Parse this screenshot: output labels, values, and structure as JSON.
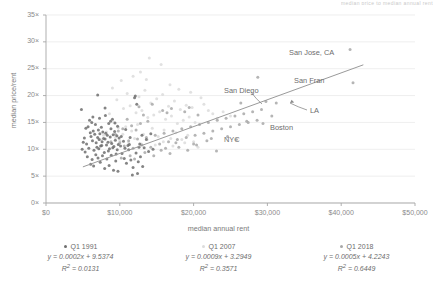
{
  "clipped_title": "median price to median annual rent",
  "axes": {
    "xlabel": "median annual rent",
    "ylabel": "median price/rent",
    "xticks": [
      "$0",
      "$10,000",
      "$20,000",
      "$30,000",
      "$40,000",
      "$50,000"
    ],
    "yticks": [
      "0×",
      "5×",
      "10×",
      "15×",
      "20×",
      "25×",
      "30×",
      "35×"
    ]
  },
  "annotations": [
    {
      "name": "san-jose",
      "text": "San Jose, CA",
      "x": 289,
      "y": 48
    },
    {
      "name": "san-fran",
      "text": "San Fran",
      "x": 294,
      "y": 76
    },
    {
      "name": "san-diego",
      "text": "San Diego",
      "x": 224,
      "y": 86
    },
    {
      "name": "la",
      "text": "LA",
      "x": 310,
      "y": 106
    },
    {
      "name": "boston",
      "text": "Boston",
      "x": 270,
      "y": 123
    },
    {
      "name": "nyc",
      "text": "NYC",
      "x": 224,
      "y": 135
    }
  ],
  "legend": [
    {
      "label": "Q1 1991",
      "color": "#6f6f6f",
      "equation": "y = 0.0002x + 9.5374",
      "r2_value": "0.0131"
    },
    {
      "label": "Q1 2007",
      "color": "#dcdcdc",
      "equation": "y = 0.0009x + 3.2949",
      "r2_value": "0.3571"
    },
    {
      "label": "Q1 2018",
      "color": "#a8a8a8",
      "equation": "y = 0.0005x + 4.2243",
      "r2_value": "0.6449"
    }
  ],
  "chart_data": {
    "type": "scatter",
    "title": "median price to median annual rent",
    "xlabel": "median annual rent",
    "ylabel": "median price/rent",
    "xlim": [
      0,
      50000
    ],
    "ylim": [
      0,
      35
    ],
    "grid": "horizontal",
    "legend_position": "bottom",
    "trendlines": [
      {
        "name": "Q1 1991",
        "slope": 0.0002,
        "intercept": 9.5374,
        "r2": 0.0131,
        "visible": false
      },
      {
        "name": "Q1 2007",
        "slope": 0.0009,
        "intercept": 3.2949,
        "r2": 0.3571,
        "visible": false
      },
      {
        "name": "Q1 2018",
        "slope": 0.0005,
        "intercept": 4.2243,
        "r2": 0.6449,
        "visible": true,
        "x_range": [
          5000,
          43000
        ]
      }
    ],
    "highlighted_cities": [
      {
        "name": "San Jose, CA",
        "x": 41200,
        "y": 28.6
      },
      {
        "name": "San Fran",
        "x": 41600,
        "y": 22.4
      },
      {
        "name": "San Diego",
        "x": 30000,
        "y": 18.9
      },
      {
        "name": "LA",
        "x": 31200,
        "y": 18.6
      },
      {
        "name": "Boston",
        "x": 28700,
        "y": 23.4
      },
      {
        "name": "NYC",
        "x": 23100,
        "y": 9.7
      }
    ],
    "series": [
      {
        "name": "Q1 1991",
        "color": "#6f6f6f",
        "points": [
          [
            4800,
            17.4
          ],
          [
            5200,
            12.1
          ],
          [
            5400,
            13.9
          ],
          [
            5500,
            11.0
          ],
          [
            5700,
            14.2
          ],
          [
            5800,
            10.2
          ],
          [
            6000,
            13.1
          ],
          [
            6100,
            12.4
          ],
          [
            6200,
            15.0
          ],
          [
            6300,
            11.6
          ],
          [
            6400,
            13.4
          ],
          [
            6500,
            9.8
          ],
          [
            6600,
            12.8
          ],
          [
            6700,
            14.6
          ],
          [
            6800,
            11.2
          ],
          [
            6900,
            10.4
          ],
          [
            7000,
            20.1
          ],
          [
            7000,
            12.2
          ],
          [
            7100,
            13.6
          ],
          [
            7200,
            11.8
          ],
          [
            7300,
            12.9
          ],
          [
            7400,
            10.6
          ],
          [
            7500,
            14.1
          ],
          [
            7600,
            11.4
          ],
          [
            7700,
            13.2
          ],
          [
            7800,
            12.0
          ],
          [
            7900,
            9.4
          ],
          [
            8000,
            17.7
          ],
          [
            8000,
            11.9
          ],
          [
            8100,
            13.0
          ],
          [
            8200,
            10.8
          ],
          [
            8300,
            12.6
          ],
          [
            8400,
            11.3
          ],
          [
            8500,
            14.8
          ],
          [
            8600,
            10.1
          ],
          [
            8700,
            12.3
          ],
          [
            8800,
            13.8
          ],
          [
            8900,
            11.1
          ],
          [
            9000,
            15.6
          ],
          [
            9100,
            12.7
          ],
          [
            9200,
            10.5
          ],
          [
            9300,
            13.3
          ],
          [
            9400,
            11.7
          ],
          [
            9500,
            9.1
          ],
          [
            9600,
            12.5
          ],
          [
            9700,
            14.3
          ],
          [
            9800,
            10.9
          ],
          [
            9900,
            12.1
          ],
          [
            5600,
            8.6
          ],
          [
            6050,
            7.2
          ],
          [
            6250,
            8.1
          ],
          [
            6450,
            6.9
          ],
          [
            6750,
            9.0
          ],
          [
            7050,
            8.4
          ],
          [
            7350,
            7.6
          ],
          [
            7650,
            8.8
          ],
          [
            7950,
            6.4
          ],
          [
            8250,
            8.2
          ],
          [
            8550,
            7.0
          ],
          [
            8850,
            8.9
          ],
          [
            9150,
            6.1
          ],
          [
            9450,
            7.8
          ],
          [
            9750,
            5.9
          ],
          [
            10200,
            12.4
          ],
          [
            10500,
            11.5
          ],
          [
            10800,
            13.7
          ],
          [
            11100,
            10.7
          ],
          [
            11400,
            12.2
          ],
          [
            11700,
            5.2
          ],
          [
            12000,
            19.6
          ],
          [
            12100,
            19.9
          ],
          [
            12300,
            18.4
          ],
          [
            12400,
            5.5
          ],
          [
            12700,
            11.0
          ],
          [
            13000,
            12.6
          ],
          [
            13300,
            10.3
          ],
          [
            13600,
            11.8
          ],
          [
            13900,
            9.6
          ],
          [
            14200,
            12.9
          ],
          [
            14500,
            10.0
          ],
          [
            10300,
            9.2
          ],
          [
            10600,
            8.3
          ],
          [
            10900,
            7.4
          ],
          [
            11200,
            9.9
          ],
          [
            11500,
            8.0
          ],
          [
            11800,
            6.6
          ],
          [
            12200,
            9.3
          ],
          [
            12500,
            7.7
          ],
          [
            12800,
            8.6
          ],
          [
            13100,
            6.8
          ],
          [
            5900,
            15.4
          ],
          [
            6350,
            16.0
          ],
          [
            7250,
            15.8
          ],
          [
            8050,
            16.3
          ],
          [
            8750,
            15.2
          ],
          [
            9350,
            14.9
          ],
          [
            4900,
            10.0
          ],
          [
            5050,
            11.3
          ],
          [
            5300,
            9.5
          ],
          [
            7150,
            10.1
          ],
          [
            7550,
            10.7
          ],
          [
            8450,
            9.7
          ],
          [
            9050,
            10.3
          ],
          [
            9650,
            9.9
          ],
          [
            10100,
            10.6
          ],
          [
            10700,
            10.2
          ],
          [
            11300,
            10.9
          ],
          [
            12600,
            10.4
          ]
        ]
      },
      {
        "name": "Q1 2007",
        "color": "#dcdcdc",
        "points": [
          [
            9000,
            21.4
          ],
          [
            9600,
            19.2
          ],
          [
            10200,
            22.8
          ],
          [
            10500,
            17.6
          ],
          [
            11000,
            20.4
          ],
          [
            11400,
            18.1
          ],
          [
            11800,
            23.6
          ],
          [
            12200,
            16.8
          ],
          [
            12600,
            19.8
          ],
          [
            13000,
            17.2
          ],
          [
            13400,
            21.0
          ],
          [
            13800,
            15.9
          ],
          [
            14200,
            18.6
          ],
          [
            14600,
            16.4
          ],
          [
            15000,
            19.4
          ],
          [
            15400,
            17.0
          ],
          [
            15800,
            20.2
          ],
          [
            16200,
            15.6
          ],
          [
            16600,
            18.0
          ],
          [
            17000,
            16.2
          ],
          [
            17400,
            19.0
          ],
          [
            17800,
            14.8
          ],
          [
            18200,
            17.4
          ],
          [
            18600,
            15.4
          ],
          [
            19000,
            18.2
          ],
          [
            19400,
            16.0
          ],
          [
            19800,
            17.8
          ],
          [
            20200,
            15.0
          ],
          [
            14000,
            27.0
          ],
          [
            15600,
            25.8
          ],
          [
            12800,
            24.4
          ],
          [
            13600,
            23.0
          ],
          [
            16800,
            22.0
          ],
          [
            18000,
            21.2
          ],
          [
            19600,
            20.6
          ],
          [
            21000,
            19.6
          ],
          [
            10800,
            14.2
          ],
          [
            11600,
            13.4
          ],
          [
            12400,
            14.6
          ],
          [
            13200,
            12.8
          ],
          [
            14400,
            13.9
          ],
          [
            15200,
            12.4
          ],
          [
            16000,
            13.6
          ],
          [
            16900,
            12.0
          ],
          [
            17600,
            13.1
          ],
          [
            18400,
            11.8
          ],
          [
            19200,
            12.6
          ],
          [
            20000,
            11.4
          ],
          [
            9400,
            12.2
          ],
          [
            10000,
            11.6
          ],
          [
            10400,
            12.8
          ],
          [
            11200,
            11.2
          ],
          [
            12000,
            12.0
          ],
          [
            12900,
            11.0
          ],
          [
            13700,
            11.8
          ],
          [
            14800,
            10.8
          ],
          [
            15900,
            11.4
          ],
          [
            17200,
            10.6
          ],
          [
            18800,
            11.2
          ],
          [
            20600,
            10.4
          ],
          [
            21400,
            18.4
          ],
          [
            22000,
            17.2
          ],
          [
            22600,
            16.6
          ],
          [
            23200,
            15.8
          ],
          [
            24000,
            17.0
          ],
          [
            25000,
            16.2
          ],
          [
            8600,
            16.6
          ],
          [
            9200,
            15.0
          ],
          [
            9800,
            14.0
          ],
          [
            8200,
            13.2
          ],
          [
            7800,
            12.6
          ],
          [
            7400,
            11.8
          ]
        ]
      },
      {
        "name": "Q1 2018",
        "color": "#a8a8a8",
        "points": [
          [
            10000,
            11.2
          ],
          [
            10600,
            10.6
          ],
          [
            11200,
            11.6
          ],
          [
            11800,
            10.2
          ],
          [
            12400,
            11.9
          ],
          [
            13000,
            10.8
          ],
          [
            13600,
            12.2
          ],
          [
            14200,
            10.4
          ],
          [
            14800,
            12.6
          ],
          [
            15400,
            11.0
          ],
          [
            16000,
            13.0
          ],
          [
            16600,
            11.4
          ],
          [
            17200,
            13.4
          ],
          [
            17800,
            11.8
          ],
          [
            18400,
            13.8
          ],
          [
            19000,
            12.2
          ],
          [
            19600,
            14.2
          ],
          [
            20200,
            12.6
          ],
          [
            20800,
            14.6
          ],
          [
            21400,
            13.0
          ],
          [
            22000,
            15.0
          ],
          [
            22600,
            13.4
          ],
          [
            23200,
            15.4
          ],
          [
            23800,
            13.8
          ],
          [
            24400,
            15.8
          ],
          [
            25000,
            14.2
          ],
          [
            25600,
            16.2
          ],
          [
            26200,
            14.6
          ],
          [
            26800,
            16.6
          ],
          [
            27400,
            15.0
          ],
          [
            28000,
            17.0
          ],
          [
            28600,
            15.4
          ],
          [
            29200,
            17.4
          ],
          [
            29800,
            18.9
          ],
          [
            30600,
            16.2
          ],
          [
            31200,
            18.6
          ],
          [
            15800,
            17.2
          ],
          [
            16400,
            16.8
          ],
          [
            17000,
            17.6
          ],
          [
            18800,
            17.0
          ],
          [
            19400,
            17.8
          ],
          [
            20600,
            16.4
          ],
          [
            12600,
            17.9
          ],
          [
            13200,
            16.4
          ],
          [
            13800,
            15.2
          ],
          [
            14400,
            18.4
          ],
          [
            11000,
            15.6
          ],
          [
            11600,
            14.4
          ],
          [
            12200,
            13.6
          ],
          [
            12800,
            14.8
          ],
          [
            9400,
            12.8
          ],
          [
            9800,
            13.4
          ],
          [
            10400,
            13.8
          ],
          [
            8800,
            11.4
          ],
          [
            23100,
            9.7
          ],
          [
            21800,
            11.6
          ],
          [
            20400,
            10.8
          ],
          [
            19200,
            9.8
          ],
          [
            18000,
            10.4
          ],
          [
            16800,
            9.2
          ],
          [
            15600,
            9.8
          ],
          [
            14600,
            8.8
          ],
          [
            13400,
            9.4
          ],
          [
            12000,
            8.2
          ],
          [
            11400,
            8.8
          ],
          [
            10200,
            8.4
          ],
          [
            26400,
            18.6
          ],
          [
            27200,
            15.2
          ],
          [
            28700,
            23.4
          ],
          [
            29400,
            14.8
          ],
          [
            41200,
            28.6
          ],
          [
            41600,
            22.4
          ],
          [
            24600,
            12.4
          ],
          [
            25800,
            11.8
          ],
          [
            22400,
            12.0
          ],
          [
            20000,
            11.0
          ],
          [
            17600,
            11.2
          ],
          [
            16200,
            10.2
          ]
        ]
      }
    ]
  }
}
